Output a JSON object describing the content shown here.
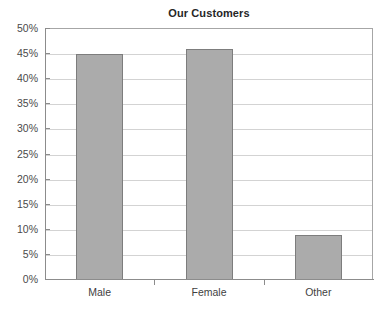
{
  "chart_data": {
    "type": "bar",
    "title": "Our Customers",
    "xlabel": "",
    "ylabel": "",
    "categories": [
      "Male",
      "Female",
      "Other"
    ],
    "values": [
      45,
      46,
      9
    ],
    "value_unit": "%",
    "ylim": [
      0,
      50
    ],
    "ytick_labels": [
      "0%",
      "5%",
      "10%",
      "15%",
      "20%",
      "25%",
      "30%",
      "35%",
      "40%",
      "45%",
      "50%"
    ],
    "ytick_values": [
      0,
      5,
      10,
      15,
      20,
      25,
      30,
      35,
      40,
      45,
      50
    ],
    "ytick_step": 5,
    "grid": true,
    "grid_axis": "y",
    "legend": false,
    "legend_position": "none",
    "series": [
      {
        "name": "Our Customers",
        "values": [
          45,
          46,
          9
        ]
      }
    ],
    "colors": {
      "bar_fill": "#ababab",
      "bar_border": "#7d7d7d",
      "gridline": "#d3d3d3",
      "axis": "#8c8c8c",
      "plot_border": "#a6a6a6",
      "title_text": "#262626",
      "tick_text": "#4a4a4a",
      "background": "#ffffff"
    }
  }
}
